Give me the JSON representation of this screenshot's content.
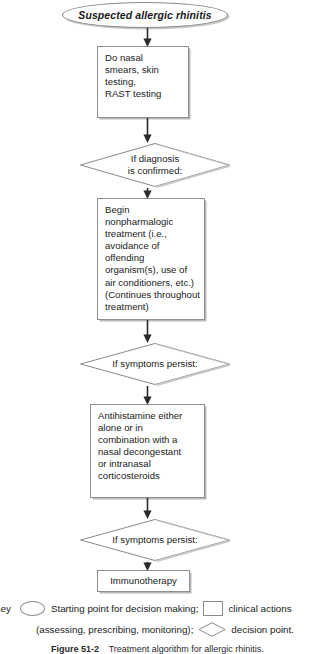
{
  "figure": {
    "start_node": {
      "label": "Suspected allergic rhinitis",
      "shape": "ellipse"
    },
    "nodes": [
      {
        "id": "diagnostics",
        "shape": "rectangle",
        "label": "Do nasal\nsmears, skin\ntesting,\nRAST testing"
      },
      {
        "id": "confirmed",
        "shape": "diamond",
        "label": "If diagnosis\nis confirmed:"
      },
      {
        "id": "nonpharmacologic",
        "shape": "rectangle",
        "label": "Begin\nnonpharmalogic\ntreatment (i.e.,\navoidance of offending\norganism(s), use of\nair conditioners, etc.)\n(Continues throughout\ntreatment)"
      },
      {
        "id": "persist-1",
        "shape": "diamond",
        "label": "If symptoms persist:"
      },
      {
        "id": "antihistamine",
        "shape": "rectangle",
        "label": "Antihistamine either\nalone or in\ncombination with a\nnasal decongestant\nor intranasal\ncorticosteroids"
      },
      {
        "id": "persist-2",
        "shape": "diamond",
        "label": "If symptoms persist:"
      },
      {
        "id": "immunotherapy",
        "shape": "rectangle",
        "label": "Immunotherapy"
      }
    ],
    "legend": {
      "key_label": "Key",
      "ellipse_text": "Starting point for decision making;",
      "rect_text": "clinical actions",
      "continuation_text": "(assessing, prescribing, monitoring);",
      "diamond_text": "decision point."
    },
    "caption": {
      "number": "Figure 51-2",
      "text": "Treatment algorithm for allergic rhinitis."
    },
    "colors": {
      "stroke": "#8a8a8a",
      "shadow": "#bdbdbd",
      "text": "#222222",
      "background": "#ffffff"
    }
  }
}
